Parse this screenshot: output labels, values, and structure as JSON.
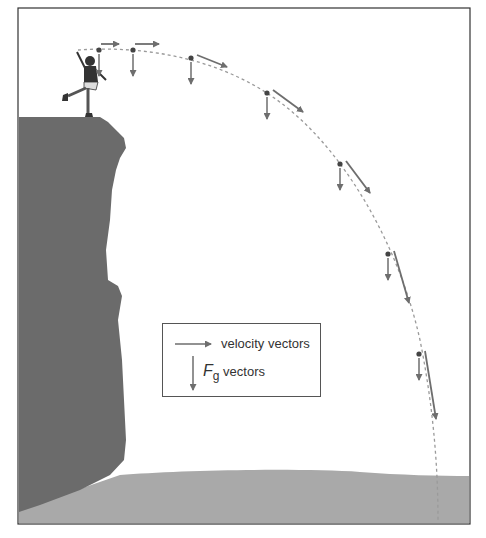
{
  "figure": {
    "colors": {
      "cliff": "#6b6b6b",
      "ground": "#a9a9a9",
      "vector": "#6e6e6e",
      "path": "#9a9a9a",
      "frame": "#333333"
    }
  },
  "legend": {
    "velocity_label": "velocity vectors",
    "fg_symbol": "F",
    "fg_subscript": "g",
    "fg_label": "vectors"
  },
  "points": [
    {
      "x": 99,
      "y": 50,
      "vx": 18,
      "vy": 0
    },
    {
      "x": 133,
      "y": 50,
      "vx": 24,
      "vy": 0
    },
    {
      "x": 191,
      "y": 58,
      "vx": 30,
      "vy": 12
    },
    {
      "x": 267,
      "y": 93,
      "vx": 30,
      "vy": 22
    },
    {
      "x": 340,
      "y": 164,
      "vx": 24,
      "vy": 32
    },
    {
      "x": 388,
      "y": 254,
      "vx": 15,
      "vy": 52
    },
    {
      "x": 419,
      "y": 354,
      "vx": 11,
      "vy": 68
    }
  ]
}
